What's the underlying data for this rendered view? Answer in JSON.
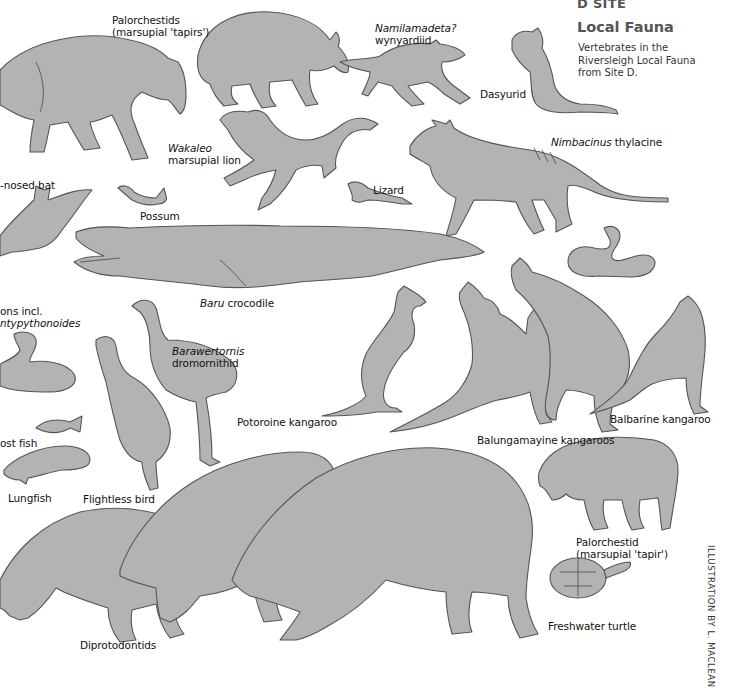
{
  "header": {
    "site": "D SITE",
    "title": "Local Fauna",
    "description": "Vertebrates in the Riversleigh Local Fauna from Site D."
  },
  "credit": "ILLUSTRATION BY L. MACLEAN",
  "colors": {
    "silhouette_fill": "#b3b3b3",
    "silhouette_outline": "#555555",
    "background": "#ffffff",
    "header_text": "#555555"
  },
  "labels": {
    "palorchestids": {
      "line1": "Palorchestids",
      "line2": "(marsupial 'tapirs')"
    },
    "namilamadeta": {
      "italic": "Namilamadeta?",
      "line2": "wynyardiid"
    },
    "dasyurid": "Dasyurid",
    "wakaleo": {
      "italic": "Wakaleo",
      "line2": "marsupial lion"
    },
    "nimbacinus": {
      "italic": "Nimbacinus",
      "rest": " thylacine"
    },
    "bat": "-nosed bat",
    "possum": "Possum",
    "lizard": "Lizard",
    "baru": {
      "italic": "Baru",
      "rest": " crocodile"
    },
    "pythons": {
      "line1": "ons incl.",
      "italic": "ntypythonoides"
    },
    "barawertornis": {
      "italic": "Barawertornis",
      "line2": "dromornithid"
    },
    "potoroine": "Potoroine kangaroo",
    "balbarine": "Balbarine kangaroo",
    "balungamayine": "Balungamayine kangaroos",
    "bony_fish": "ost fish",
    "lungfish": "Lungfish",
    "flightless_bird": "Flightless bird",
    "palorchestid": {
      "line1": "Palorchestid",
      "line2": "(marsupial 'tapir')"
    },
    "turtle": "Freshwater turtle",
    "diprotodontids": "Diprotodontids"
  }
}
